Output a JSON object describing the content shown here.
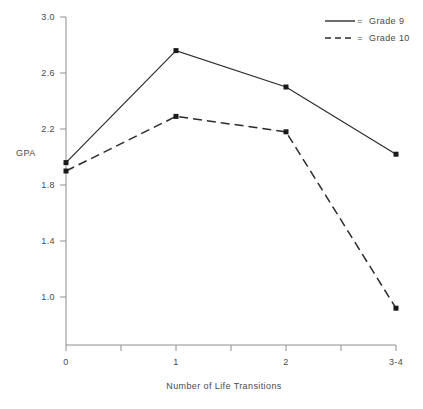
{
  "chart_data": {
    "type": "line",
    "title": "",
    "subtitle": "",
    "xlabel": "Number of Life Transitions",
    "ylabel": "GPA",
    "categories": [
      "0",
      "1",
      "2",
      "3-4"
    ],
    "x": [
      0,
      1,
      2,
      3
    ],
    "ylim": [
      0.8,
      3.0
    ],
    "xlim": [
      -0.05,
      3.05
    ],
    "yticks": [
      "1.0",
      "1.4",
      "1.8",
      "2.2",
      "2.6",
      "3.0"
    ],
    "ytick_values": [
      1.0,
      1.4,
      1.8,
      2.2,
      2.6,
      3.0
    ],
    "xticks": [
      "0",
      "1",
      "2",
      "3-4"
    ],
    "grid": false,
    "legend_position": "top-right",
    "series": [
      {
        "name": "Grade 9",
        "style": "solid",
        "marker": "square",
        "values": [
          1.96,
          2.76,
          2.5,
          2.02
        ]
      },
      {
        "name": "Grade 10",
        "style": "dashed",
        "marker": "square",
        "values": [
          1.9,
          2.29,
          2.18,
          0.92
        ]
      }
    ],
    "legend_separator": "="
  },
  "axis": {
    "y_label_text": "GPA",
    "x_label_text": "Number of Life Transitions"
  },
  "legend": {
    "entries": [
      {
        "label": "Grade 9",
        "separator": "="
      },
      {
        "label": "Grade 10",
        "separator": "="
      }
    ]
  },
  "colors": {
    "line": "#2b2b2b",
    "axis": "#8e8e8e",
    "text": "#4a4a4a",
    "background": "#ffffff"
  }
}
